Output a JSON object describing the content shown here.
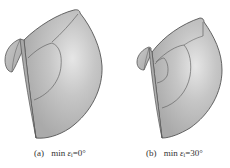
{
  "figure": {
    "panels": [
      {
        "id": "a",
        "label": "(a)",
        "caption_prefix": "min",
        "symbol": "ε",
        "subscript": "i",
        "equals": "=",
        "value": "0°"
      },
      {
        "id": "b",
        "label": "(b)",
        "caption_prefix": "min",
        "symbol": "ε",
        "subscript": "i",
        "equals": "=",
        "value": "30°"
      }
    ],
    "colors": {
      "surface": "#b8b8b8",
      "surface_highlight": "#e4e4e4",
      "edge": "#555555",
      "inner_line": "#666666",
      "caption_text": "#333333"
    }
  }
}
